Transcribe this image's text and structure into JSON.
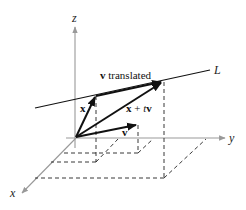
{
  "figure": {
    "axes": {
      "x_label": "x",
      "y_label": "y",
      "z_label": "z",
      "color": "#999999"
    },
    "labels": {
      "line_label": "L",
      "translated_v": "v",
      "translated_word": " translated",
      "x_vector": "x",
      "sum_x": "x",
      "sum_plus": " + ",
      "sum_t": "t",
      "sum_v": "v",
      "v_vector": "v"
    },
    "colors": {
      "vector": "#111111",
      "line": "#111111",
      "dashed": "#222222",
      "background": "#ffffff"
    }
  }
}
